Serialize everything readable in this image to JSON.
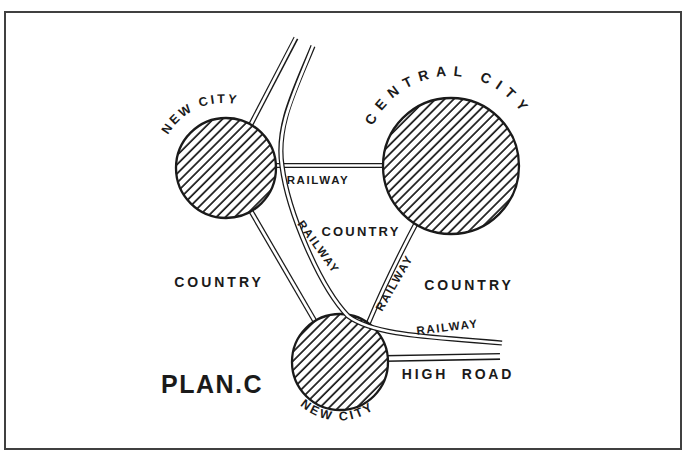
{
  "colors": {
    "ink": "#1a1a1a",
    "paper": "#ffffff",
    "frame": "#404040"
  },
  "plan": {
    "caption": "PLAN.C",
    "cities": {
      "new_city_nw": "NEW CITY",
      "central_city": "CENTRAL CITY",
      "new_city_south": "NEW CITY"
    },
    "regions": {
      "country_west": "COUNTRY",
      "country_center": "COUNTRY",
      "country_east": "COUNTRY"
    },
    "routes": {
      "railway_intercity": "RAILWAY",
      "railway_arc": "RAILWAY",
      "railway_central_south": "RAILWAY",
      "railway_southeast": "RAILWAY",
      "high_road": "HIGH ROAD"
    }
  }
}
